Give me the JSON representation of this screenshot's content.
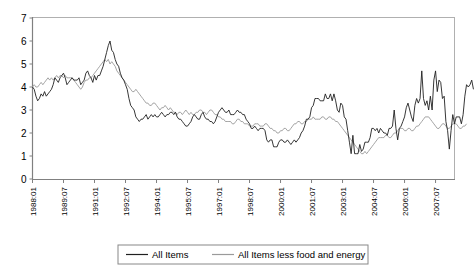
{
  "chart_data": {
    "type": "line",
    "title": "",
    "xlabel": "",
    "ylabel": "",
    "ylim": [
      0,
      7
    ],
    "yticks": [
      0,
      1,
      2,
      3,
      4,
      5,
      6,
      7
    ],
    "grid": false,
    "legend_position": "bottom",
    "xtick_labels": [
      "1988:01",
      "1989:07",
      "1991:01",
      "1992:07",
      "1994:01",
      "1995:07",
      "1997:01",
      "1998:07",
      "2000:01",
      "2001:07",
      "2003:01",
      "2004:07",
      "2006:01",
      "2007:07"
    ],
    "xtick_indices": [
      0,
      18,
      36,
      54,
      72,
      90,
      108,
      126,
      144,
      162,
      180,
      198,
      216,
      234
    ],
    "x_start": "1988:01",
    "x_end": "2008:06",
    "n_points": 246,
    "series": [
      {
        "name": "All Items",
        "color": "#202020",
        "values": [
          4.0,
          3.9,
          3.6,
          3.4,
          3.5,
          3.7,
          3.6,
          3.8,
          3.6,
          3.7,
          3.8,
          3.9,
          4.1,
          4.4,
          4.3,
          4.2,
          4.4,
          4.5,
          4.6,
          4.4,
          4.1,
          4.2,
          4.3,
          4.4,
          4.3,
          4.3,
          4.3,
          4.4,
          4.1,
          4.2,
          4.3,
          4.6,
          4.7,
          4.5,
          4.4,
          4.2,
          4.5,
          4.3,
          4.5,
          4.5,
          4.7,
          4.9,
          5.2,
          5.5,
          5.8,
          6.0,
          5.6,
          5.5,
          5.2,
          5.0,
          4.9,
          4.6,
          4.4,
          4.3,
          4.1,
          3.9,
          3.5,
          3.2,
          3.1,
          3.0,
          2.7,
          2.6,
          2.5,
          2.6,
          2.6,
          2.7,
          2.8,
          2.6,
          2.7,
          2.8,
          2.7,
          2.8,
          2.7,
          2.7,
          2.8,
          2.9,
          2.8,
          2.7,
          2.8,
          2.8,
          2.9,
          2.9,
          2.8,
          2.9,
          2.7,
          2.6,
          2.6,
          2.5,
          2.4,
          2.3,
          2.3,
          2.4,
          2.5,
          2.7,
          2.8,
          2.7,
          2.6,
          2.6,
          2.8,
          2.9,
          2.7,
          2.6,
          2.6,
          2.5,
          2.5,
          2.4,
          2.5,
          2.7,
          2.9,
          3.0,
          3.1,
          3.0,
          2.9,
          2.9,
          3.0,
          2.8,
          2.8,
          2.8,
          2.9,
          3.0,
          2.9,
          2.9,
          2.8,
          2.8,
          2.6,
          2.5,
          2.4,
          2.2,
          2.2,
          2.3,
          2.2,
          2.1,
          2.2,
          2.2,
          2.2,
          2.1,
          1.7,
          1.6,
          1.7,
          1.7,
          1.4,
          1.4,
          1.4,
          1.6,
          1.7,
          1.7,
          1.6,
          1.6,
          1.7,
          1.6,
          1.5,
          1.6,
          1.7,
          1.6,
          1.7,
          1.8,
          2.0,
          2.1,
          2.3,
          2.6,
          2.6,
          2.7,
          3.1,
          3.2,
          3.5,
          3.5,
          3.5,
          3.4,
          3.4,
          3.4,
          3.7,
          3.5,
          3.5,
          3.7,
          3.4,
          3.7,
          3.4,
          3.0,
          2.9,
          3.3,
          3.2,
          2.7,
          2.6,
          2.1,
          1.6,
          1.1,
          1.9,
          1.1,
          1.1,
          1.1,
          1.5,
          1.2,
          1.3,
          1.6,
          1.6,
          1.6,
          1.8,
          2.2,
          2.2,
          2.1,
          2.2,
          2.0,
          2.2,
          2.1,
          2.0,
          2.0,
          1.9,
          2.2,
          2.2,
          2.3,
          3.0,
          2.2,
          1.7,
          2.2,
          2.3,
          2.5,
          2.7,
          3.1,
          3.3,
          3.0,
          2.7,
          2.5,
          3.2,
          3.5,
          3.3,
          3.5,
          4.7,
          3.5,
          3.2,
          3.4,
          3.0,
          3.6,
          3.0,
          4.3,
          4.7,
          3.8,
          4.3,
          4.2,
          3.5,
          3.6,
          2.5,
          2.1,
          1.3,
          2.1,
          2.8,
          2.4,
          2.7,
          2.7,
          2.7,
          2.4,
          2.8,
          3.6,
          4.1,
          4.0,
          4.1,
          4.3,
          3.9
        ]
      },
      {
        "name": "All Items less food and energy",
        "color": "#9a9a9a",
        "values": [
          4.0,
          4.1,
          4.0,
          4.0,
          4.1,
          4.2,
          4.1,
          4.2,
          4.3,
          4.4,
          4.3,
          4.4,
          4.3,
          4.4,
          4.5,
          4.4,
          4.5,
          4.5,
          4.4,
          4.5,
          4.4,
          4.4,
          4.4,
          4.4,
          4.3,
          4.2,
          4.1,
          4.0,
          3.9,
          4.0,
          4.2,
          4.3,
          4.3,
          4.4,
          4.4,
          4.5,
          4.6,
          4.7,
          4.8,
          4.9,
          5.0,
          5.1,
          5.2,
          5.1,
          5.2,
          5.0,
          5.1,
          5.0,
          4.9,
          4.7,
          4.6,
          4.5,
          4.4,
          4.3,
          4.2,
          4.1,
          4.0,
          3.9,
          3.8,
          3.8,
          3.9,
          3.8,
          3.7,
          3.6,
          3.5,
          3.4,
          3.3,
          3.3,
          3.2,
          3.2,
          3.3,
          3.3,
          3.2,
          3.1,
          3.0,
          3.1,
          3.1,
          3.2,
          3.1,
          3.0,
          3.1,
          3.0,
          2.9,
          2.9,
          2.8,
          2.9,
          2.9,
          2.8,
          2.9,
          3.0,
          2.9,
          2.8,
          2.9,
          2.8,
          2.8,
          2.9,
          2.9,
          3.0,
          3.0,
          2.9,
          2.9,
          2.8,
          2.9,
          3.0,
          3.0,
          2.9,
          2.8,
          2.8,
          2.7,
          2.7,
          2.6,
          2.6,
          2.5,
          2.5,
          2.5,
          2.5,
          2.4,
          2.4,
          2.5,
          2.6,
          2.6,
          2.5,
          2.5,
          2.4,
          2.4,
          2.4,
          2.3,
          2.3,
          2.3,
          2.4,
          2.4,
          2.4,
          2.3,
          2.3,
          2.3,
          2.4,
          2.4,
          2.3,
          2.2,
          2.2,
          2.1,
          2.1,
          2.0,
          2.0,
          2.1,
          2.1,
          2.2,
          2.2,
          2.1,
          2.1,
          2.2,
          2.3,
          2.4,
          2.4,
          2.5,
          2.5,
          2.4,
          2.4,
          2.5,
          2.5,
          2.6,
          2.6,
          2.6,
          2.7,
          2.6,
          2.6,
          2.6,
          2.6,
          2.7,
          2.7,
          2.6,
          2.6,
          2.7,
          2.7,
          2.6,
          2.6,
          2.5,
          2.5,
          2.4,
          2.3,
          2.2,
          2.1,
          2.0,
          1.9,
          1.8,
          1.7,
          1.6,
          1.5,
          1.4,
          1.3,
          1.2,
          1.1,
          1.1,
          1.2,
          1.1,
          1.2,
          1.3,
          1.4,
          1.5,
          1.6,
          1.7,
          1.8,
          1.8,
          1.8,
          1.8,
          1.9,
          1.9,
          1.8,
          1.8,
          1.9,
          2.0,
          2.0,
          2.1,
          2.2,
          2.2,
          2.2,
          2.1,
          2.1,
          2.2,
          2.2,
          2.1,
          2.1,
          2.2,
          2.3,
          2.3,
          2.4,
          2.5,
          2.6,
          2.7,
          2.7,
          2.7,
          2.6,
          2.5,
          2.4,
          2.3,
          2.2,
          2.2,
          2.3,
          2.4,
          2.4,
          2.3,
          2.2,
          2.2,
          2.3,
          2.4,
          2.4,
          2.4,
          2.3,
          2.2,
          2.2,
          2.3,
          2.3,
          2.4
        ]
      }
    ]
  },
  "legend": {
    "items": [
      {
        "label": "All Items"
      },
      {
        "label": "All Items less food and energy"
      }
    ]
  }
}
